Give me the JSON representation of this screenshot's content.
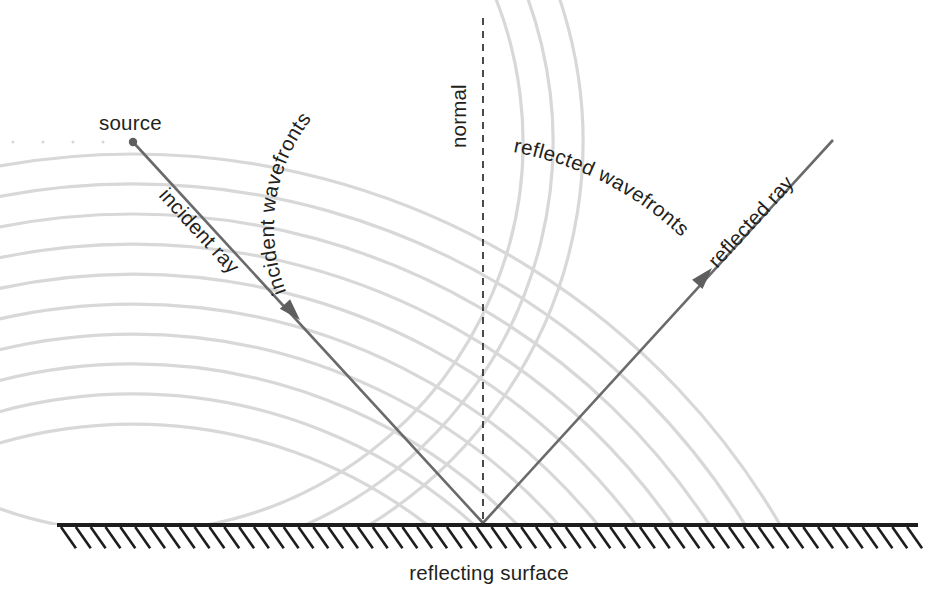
{
  "figure": {
    "title_absent": true,
    "type": "physics-diagram",
    "background_color": "#ffffff"
  },
  "colors": {
    "wavefront": "#d8d8d8",
    "ray": "#6a6a6a",
    "normal": "#2b2b2b",
    "surface": "#1d1d1d",
    "label_text": "#231f20",
    "source_dot": "#5e5e5e"
  },
  "labels": {
    "source": "source",
    "incident_ray": "incident ray",
    "incident_wavefronts": "incident wavefronts",
    "normal": "normal",
    "reflected_wavefronts": "reflected wavefronts",
    "reflected_ray": "reflected ray",
    "reflecting_surface": "reflecting surface"
  },
  "geometry": {
    "source_point": {
      "x": 133,
      "y": 142
    },
    "reflection_point": {
      "x": 483,
      "y": 523
    },
    "image_point": {
      "x": 133,
      "y": 904
    },
    "incident_ray": {
      "x1": 133,
      "y1": 142,
      "x2": 483,
      "y2": 523
    },
    "reflected_ray": {
      "x1": 483,
      "y1": 523,
      "x2": 833,
      "y2": 140
    },
    "incident_arrow_at": {
      "x": 300,
      "y": 320
    },
    "reflected_arrow_at": {
      "x": 712,
      "y": 268
    },
    "normal_line": {
      "x": 483,
      "y1": 18,
      "y2": 523
    },
    "surface_line": {
      "x1": 57,
      "x2": 918,
      "y": 525
    },
    "hatch_count": 58,
    "hatch_length": 26,
    "hatch_angle_deg": 55,
    "incident_wave_radii": [
      30,
      60,
      90,
      120,
      150,
      180,
      210,
      240,
      270,
      300,
      330,
      360,
      390,
      420,
      450
    ],
    "reflected_wave_radii": [
      480,
      510,
      540,
      570,
      600,
      630,
      660,
      690,
      720,
      750
    ]
  },
  "chart_data": {
    "type": "diagram",
    "elements": [
      {
        "name": "source",
        "kind": "point",
        "x": 133,
        "y": 142
      },
      {
        "name": "incident wavefronts",
        "kind": "concentric-arcs",
        "center_x": 133,
        "center_y": 142,
        "spacing": 30
      },
      {
        "name": "reflected wavefronts",
        "kind": "concentric-arcs",
        "center_x": 133,
        "center_y": 904,
        "spacing": 30
      },
      {
        "name": "incident ray",
        "kind": "arrow",
        "from": [
          133,
          142
        ],
        "to": [
          483,
          523
        ]
      },
      {
        "name": "reflected ray",
        "kind": "arrow",
        "from": [
          483,
          523
        ],
        "to": [
          833,
          140
        ]
      },
      {
        "name": "normal",
        "kind": "dashed-line",
        "from": [
          483,
          18
        ],
        "to": [
          483,
          523
        ]
      },
      {
        "name": "reflecting surface",
        "kind": "hatched-line",
        "from": [
          57,
          525
        ],
        "to": [
          918,
          525
        ]
      }
    ],
    "angles": {
      "angle_of_incidence_deg": 42.6,
      "angle_of_reflection_deg": 42.6
    }
  }
}
